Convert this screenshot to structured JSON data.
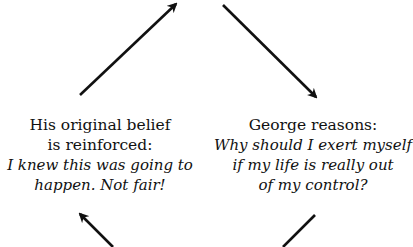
{
  "diagram": {
    "type": "cycle",
    "colors": {
      "ink": "#111111",
      "background": "#ffffff"
    },
    "nodes": {
      "left": {
        "title_lines": [
          "His original belief",
          "is reinforced:"
        ],
        "quote_lines": [
          "I knew this was going to",
          "happen. Not fair!"
        ]
      },
      "right": {
        "title_lines": [
          "George reasons:"
        ],
        "quote_lines": [
          "Why should I exert myself",
          "if my life is really out",
          "of my control?"
        ]
      }
    },
    "arrows": [
      {
        "id": "top-left",
        "direction": "up-right",
        "from": [
          80,
          95
        ],
        "to": [
          176,
          4
        ],
        "head": true
      },
      {
        "id": "top-right",
        "direction": "down-right",
        "from": [
          223,
          5
        ],
        "to": [
          316,
          97
        ],
        "head": true
      },
      {
        "id": "bottom-left",
        "direction": "up-left",
        "from": [
          113,
          247
        ],
        "to": [
          80,
          214
        ],
        "head": true
      },
      {
        "id": "bottom-right",
        "direction": "down-left",
        "from": [
          315,
          215
        ],
        "to": [
          283,
          247
        ],
        "head": false
      }
    ]
  }
}
